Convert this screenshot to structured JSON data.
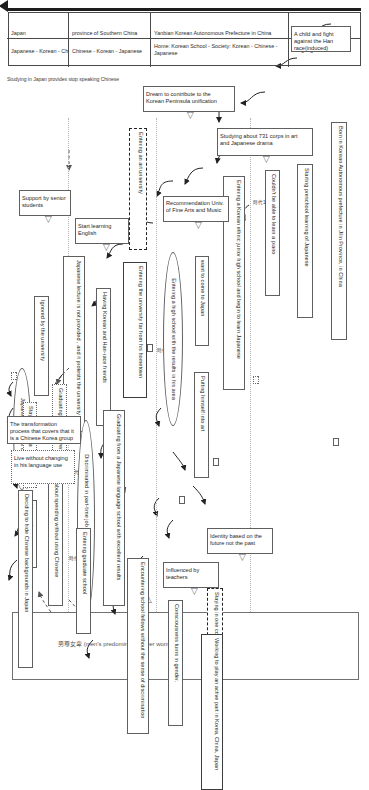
{
  "meta": {
    "timeline_label": "Irreversible time",
    "right_header": "男尊女卑 (men's predominance over women)"
  },
  "matrix": {
    "row_headers": [
      "Stay area",
      "Language environment"
    ],
    "columns": [
      {
        "area": "Yanbian Korean Autonomous Prefecture in China",
        "language": "Home: Korean   School - Society: Korean - Chinese - Japanese"
      },
      {
        "area": "province of Southern China",
        "language": "Chinese - Korean - Japanese"
      },
      {
        "area": "Japan",
        "language": "Japanese - Korean - Chinese"
      }
    ]
  },
  "side_notes": [
    "Studying in Japan provides stop speaking Chinese"
  ],
  "stage_markers": [
    "時代1",
    "時代2",
    "時代3",
    "時代4"
  ],
  "nodes": [
    {
      "id": "n1",
      "text": "Born in Korean Autonomous prefecture in Jilin Province, in China"
    },
    {
      "id": "n2",
      "text": "Starting preschool learning of Japanese"
    },
    {
      "id": "n3",
      "text": "Couldn't be able to learn a piano"
    },
    {
      "id": "n4",
      "text": "Entering a Korean ethnic junior high school and begin to learn Japanese"
    },
    {
      "id": "n5",
      "text": "want to come to Japan"
    },
    {
      "id": "n6",
      "text": "Putting himself into art"
    },
    {
      "id": "n7",
      "text": "Entering a high school with the results in his area"
    },
    {
      "id": "n8",
      "text": "Entering an art university"
    },
    {
      "id": "n9",
      "text": "Entering the university far from his hometown"
    },
    {
      "id": "n10",
      "text": "Having Korean and Han-race friends"
    },
    {
      "id": "n11",
      "text": "Japanese lecture is not provided , and it protests the university"
    },
    {
      "id": "n12",
      "text": "Ignored by the university"
    },
    {
      "id": "n13",
      "text": "Japanese lecture is open"
    },
    {
      "id": "n14",
      "text": "Graduating from a university"
    },
    {
      "id": "n15",
      "text": "Staying in China"
    },
    {
      "id": "n16",
      "text": "Visiting Japan"
    },
    {
      "id": "n17",
      "text": "Graduating from a Japanese language school with excellent results"
    },
    {
      "id": "n18",
      "text": "Discriminated in part-time job and have deep sorrow"
    },
    {
      "id": "n19",
      "text": "Thinking about spending without using Chinese"
    },
    {
      "id": "n20",
      "text": "Deciding to hide Chinese backgrounds in Japan"
    },
    {
      "id": "n21",
      "text": "Entering graduate school"
    },
    {
      "id": "n22",
      "text": "Encountering school fellows without the sense of discrimination"
    },
    {
      "id": "n23",
      "text": "Consciousness turns in gender."
    },
    {
      "id": "n24",
      "text": "Staying in one country"
    },
    {
      "id": "n25",
      "text": "Working to play an active part in Korea, China, Japan"
    }
  ],
  "factors": [
    {
      "id": "f1",
      "text": "A child and fight against the Han race(induced)"
    },
    {
      "id": "f2",
      "text": "Studying about 731 corps in art and Japanese drama"
    },
    {
      "id": "f3",
      "text": "Dream to contribute to the Korean Peninsula unification"
    },
    {
      "id": "f4",
      "text": "Recommendation Univ. of Fine Arts and Music"
    },
    {
      "id": "f5",
      "text": "Start learning English"
    },
    {
      "id": "f6",
      "text": "Support by senior students"
    },
    {
      "id": "f7",
      "text": "The transformation process that covers that it is a Chinese Korea group"
    },
    {
      "id": "f8",
      "text": "Live without changing in his  language use"
    },
    {
      "id": "f9",
      "text": "Influenced by teachers"
    },
    {
      "id": "f10",
      "text": "Identity based on the future not the past"
    }
  ]
}
